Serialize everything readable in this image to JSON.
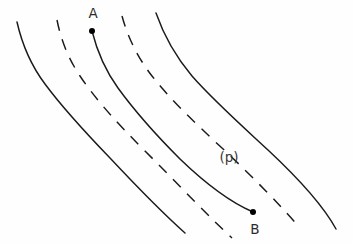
{
  "figure": {
    "title": "",
    "background_color": "#fefefe",
    "width": 353,
    "height": 245
  },
  "chart_data": {
    "type": "line",
    "title": "",
    "subtitle": "",
    "xlabel": "",
    "ylabel": "",
    "grid": false,
    "legend_position": "none",
    "xlim": [
      0,
      353
    ],
    "ylim": [
      0,
      245
    ],
    "series": [
      {
        "name": "solid-curve-left",
        "style": "solid",
        "color": "#1a1a1a",
        "path": "M 17,22 C 22,44 30,64 45,84 C 62,107 83,130 110,158 C 140,190 166,216 185,233",
        "points": [
          [
            17,
            22
          ],
          [
            24,
            45
          ],
          [
            33,
            67
          ],
          [
            45,
            84
          ],
          [
            62,
            107
          ],
          [
            83,
            130
          ],
          [
            110,
            158
          ],
          [
            140,
            190
          ],
          [
            166,
            216
          ],
          [
            185,
            233
          ]
        ]
      },
      {
        "name": "dashed-curve-left",
        "style": "dashed",
        "color": "#1a1a1a",
        "dash_pattern": "11 9",
        "path": "M 57,20 C 61,40 68,58 80,76 C 96,100 118,124 146,152 C 178,184 208,216 232,238",
        "points": [
          [
            57,
            20
          ],
          [
            62,
            42
          ],
          [
            70,
            60
          ],
          [
            80,
            76
          ],
          [
            96,
            100
          ],
          [
            118,
            124
          ],
          [
            146,
            152
          ],
          [
            178,
            184
          ],
          [
            208,
            216
          ],
          [
            232,
            238
          ]
        ]
      },
      {
        "name": "solid-curve-middle",
        "style": "solid",
        "color": "#1a1a1a",
        "path": "M 92,31 C 97,51 105,70 118,88 C 134,110 154,133 180,159 C 207,185 232,203 253,212",
        "points": [
          [
            92,
            31
          ],
          [
            99,
            52
          ],
          [
            108,
            72
          ],
          [
            118,
            88
          ],
          [
            134,
            110
          ],
          [
            154,
            133
          ],
          [
            180,
            159
          ],
          [
            207,
            185
          ],
          [
            232,
            203
          ],
          [
            253,
            212
          ]
        ],
        "endpoints": [
          "A",
          "B"
        ]
      },
      {
        "name": "dashed-curve-right",
        "style": "dashed",
        "color": "#1a1a1a",
        "dash_pattern": "11 9",
        "path": "M 122,16 C 128,38 138,58 152,76 C 170,99 194,122 222,148 C 252,176 281,206 300,228",
        "points": [
          [
            122,
            16
          ],
          [
            129,
            39
          ],
          [
            140,
            60
          ],
          [
            152,
            76
          ],
          [
            170,
            99
          ],
          [
            194,
            122
          ],
          [
            222,
            148
          ],
          [
            252,
            176
          ],
          [
            281,
            206
          ],
          [
            300,
            228
          ]
        ]
      },
      {
        "name": "solid-curve-right",
        "style": "solid",
        "color": "#1a1a1a",
        "path": "M 156,13 C 164,36 176,57 192,76 C 213,100 240,124 268,150 C 298,178 324,207 336,229",
        "points": [
          [
            156,
            13
          ],
          [
            165,
            37
          ],
          [
            178,
            58
          ],
          [
            192,
            76
          ],
          [
            213,
            100
          ],
          [
            240,
            124
          ],
          [
            268,
            150
          ],
          [
            298,
            178
          ],
          [
            324,
            207
          ],
          [
            336,
            229
          ]
        ]
      }
    ],
    "annotations": [
      {
        "name": "point-a",
        "label": "A",
        "x": 92,
        "y": 31,
        "label_x": 93,
        "label_y": 18,
        "marker": "filled-dot",
        "marker_radius": 3.0
      },
      {
        "name": "point-b",
        "label": "B",
        "x": 253,
        "y": 212,
        "label_x": 255,
        "label_y": 234,
        "marker": "filled-dot",
        "marker_radius": 3.0
      },
      {
        "name": "p-label",
        "label": "(p)",
        "x": 229,
        "y": 162,
        "label_x": 229,
        "label_y": 162,
        "marker": "none"
      }
    ]
  },
  "labels": {
    "point_a": "A",
    "point_b": "B",
    "p_annotation": "(p)"
  }
}
